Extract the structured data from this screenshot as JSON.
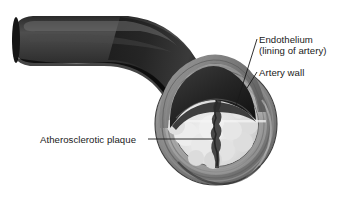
{
  "figure": {
    "background_color": "#ffffff",
    "width": 348,
    "height": 202
  },
  "labels": {
    "endothelium": {
      "line1": "Endothelium",
      "line2": "(lining of artery)"
    },
    "artery_wall": "Artery wall",
    "plaque": "Atherosclerotic plaque"
  },
  "colors": {
    "text": "#1a1a1a",
    "leader_line": "#1a1a1a",
    "tube_dark": "#151515",
    "tube_mid": "#2e2e2e",
    "tube_highlight": "#5a5a5a",
    "wall_outer": "#6f6f6f",
    "wall_mid": "#9a9a9a",
    "wall_inner": "#b4b4b4",
    "plaque_light": "#e6e6e6",
    "plaque_mid": "#d2d2d2",
    "plaque_shadow": "#a8a8a8",
    "lumen_dark": "#1c1c1c"
  },
  "anatomy": {
    "parts": [
      "artery tube",
      "cut cross-section",
      "artery wall layers",
      "endothelium lining",
      "atherosclerotic plaque",
      "narrowed lumen channel"
    ]
  }
}
